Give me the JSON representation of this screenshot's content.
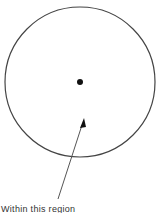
{
  "diagram": {
    "shapes": [
      "circle",
      "center-point",
      "arrow"
    ],
    "annotation": "Within this region"
  }
}
